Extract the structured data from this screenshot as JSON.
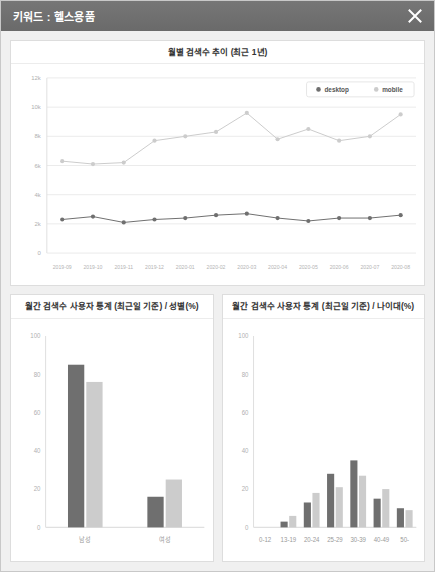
{
  "window": {
    "title": "키워드 : 헬스용품",
    "close_label": "닫기",
    "close_icon": "close-icon",
    "titlebar_color": "#6d6d6d"
  },
  "colors": {
    "desktop": "#6f6f6f",
    "mobile": "#cccccc",
    "grid": "#ebebeb",
    "axis_text": "#b0b0b0",
    "card_border": "#dddddd",
    "page_background": "#f0f0f0"
  },
  "trend_card": {
    "title": "월별 검색수 추이 (최근 1년)"
  },
  "gender_card": {
    "title": "월간 검색수 사용자 통계 (최근일 기준) / 성별(%)"
  },
  "age_card": {
    "title": "월간 검색수 사용자 통계 (최근일 기준) / 나이대(%)"
  },
  "chart_data": [
    {
      "id": "monthly-trend",
      "type": "line",
      "title": "월별 검색수 추이 (최근 1년)",
      "xlabel": "",
      "ylabel": "",
      "ylim": [
        0,
        12000
      ],
      "yticks": [
        0,
        2000,
        4000,
        6000,
        8000,
        10000,
        12000
      ],
      "ytick_labels": [
        "0",
        "2k",
        "4k",
        "6k",
        "8k",
        "10k",
        "12k"
      ],
      "grid": true,
      "legend_position": "top-right",
      "categories": [
        "2019-09",
        "2019-10",
        "2019-11",
        "2019-12",
        "2020-01",
        "2020-02",
        "2020-03",
        "2020-04",
        "2020-05",
        "2020-06",
        "2020-07",
        "2020-08"
      ],
      "series": [
        {
          "name": "desktop",
          "color": "#6f6f6f",
          "values": [
            2300,
            2500,
            2100,
            2300,
            2400,
            2600,
            2700,
            2400,
            2200,
            2400,
            2400,
            2600
          ]
        },
        {
          "name": "mobile",
          "color": "#cccccc",
          "values": [
            6300,
            6100,
            6200,
            7700,
            8000,
            8300,
            9600,
            7800,
            8500,
            7700,
            8000,
            9500
          ]
        }
      ]
    },
    {
      "id": "gender-stats",
      "type": "bar",
      "title": "월간 검색수 사용자 통계 (최근일 기준) / 성별(%)",
      "xlabel": "",
      "ylabel": "",
      "ylim": [
        0,
        100
      ],
      "yticks": [
        0,
        20,
        40,
        60,
        80,
        100
      ],
      "ytick_labels": [
        "0",
        "20",
        "40",
        "60",
        "80",
        "100"
      ],
      "grid": false,
      "categories": [
        "남성",
        "여성"
      ],
      "series": [
        {
          "name": "desktop",
          "color": "#6f6f6f",
          "values": [
            85,
            16
          ]
        },
        {
          "name": "mobile",
          "color": "#cccccc",
          "values": [
            76,
            25
          ]
        }
      ]
    },
    {
      "id": "age-stats",
      "type": "bar",
      "title": "월간 검색수 사용자 통계 (최근일 기준) / 나이대(%)",
      "xlabel": "",
      "ylabel": "",
      "ylim": [
        0,
        100
      ],
      "yticks": [
        0,
        20,
        40,
        60,
        80,
        100
      ],
      "ytick_labels": [
        "0",
        "20",
        "40",
        "60",
        "80",
        "100"
      ],
      "grid": false,
      "categories": [
        "0-12",
        "13-19",
        "20-24",
        "25-29",
        "30-39",
        "40-49",
        "50-"
      ],
      "series": [
        {
          "name": "desktop",
          "color": "#6f6f6f",
          "values": [
            0,
            3,
            13,
            28,
            35,
            15,
            10
          ]
        },
        {
          "name": "mobile",
          "color": "#cccccc",
          "values": [
            0,
            6,
            18,
            21,
            27,
            20,
            9
          ]
        }
      ]
    }
  ]
}
